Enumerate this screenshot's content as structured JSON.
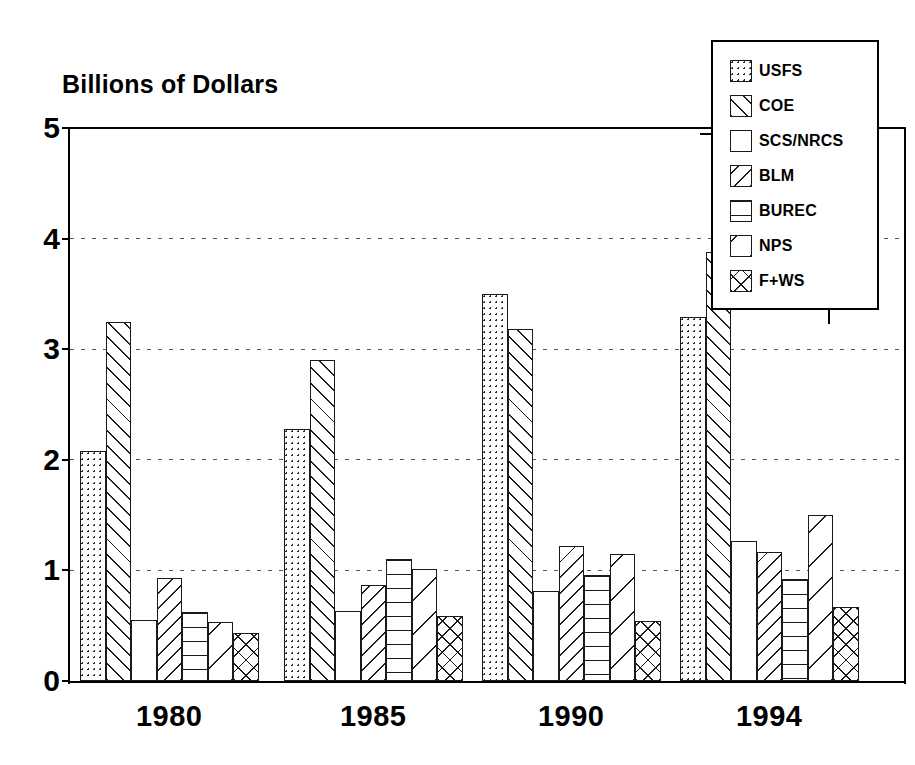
{
  "chart_data": {
    "type": "bar",
    "title": "Billions of Dollars",
    "xlabel": "",
    "ylabel": "",
    "ylim": [
      0,
      5
    ],
    "yticks": [
      0,
      1,
      2,
      3,
      4,
      5
    ],
    "ytick_labels": [
      "0",
      "1",
      "2",
      "3",
      "4",
      "5"
    ],
    "grid": "horizontal dotted gridlines at 1, 2, 3, 4",
    "legend_position": "top-right inside boxed frame",
    "categories": [
      "1980",
      "1985",
      "1990",
      "1994"
    ],
    "series": [
      {
        "name": "USFS",
        "pattern": "dots",
        "values": [
          2.08,
          2.28,
          3.5,
          3.29
        ]
      },
      {
        "name": "COE",
        "pattern": "diagonal-forward",
        "values": [
          3.25,
          2.9,
          3.18,
          3.88
        ]
      },
      {
        "name": "SCS/NRCS",
        "pattern": "blank",
        "values": [
          0.55,
          0.63,
          0.81,
          1.27
        ]
      },
      {
        "name": "BLM",
        "pattern": "diagonal-back",
        "values": [
          0.93,
          0.87,
          1.22,
          1.17
        ]
      },
      {
        "name": "BUREC",
        "pattern": "horizontal",
        "values": [
          0.62,
          1.1,
          0.96,
          0.92
        ]
      },
      {
        "name": "NPS",
        "pattern": "diagonal-back-wide",
        "values": [
          0.53,
          1.01,
          1.15,
          1.5
        ]
      },
      {
        "name": "F+WS",
        "pattern": "crosshatch",
        "values": [
          0.43,
          0.59,
          0.54,
          0.67
        ]
      }
    ]
  },
  "legend": {
    "items": [
      {
        "label": "USFS",
        "swatch": "dots-swatch"
      },
      {
        "label": "COE",
        "swatch": "diagonal-forward-swatch"
      },
      {
        "label": "SCS/NRCS",
        "swatch": "blank-swatch"
      },
      {
        "label": "BLM",
        "swatch": "diagonal-back-swatch"
      },
      {
        "label": "BUREC",
        "swatch": "horizontal-swatch"
      },
      {
        "label": "NPS",
        "swatch": "diagonal-back-wide-swatch"
      },
      {
        "label": "F+WS",
        "swatch": "crosshatch-swatch"
      }
    ]
  },
  "colors": {
    "ink": "#000000",
    "background": "#ffffff",
    "gridline": "#555555"
  }
}
